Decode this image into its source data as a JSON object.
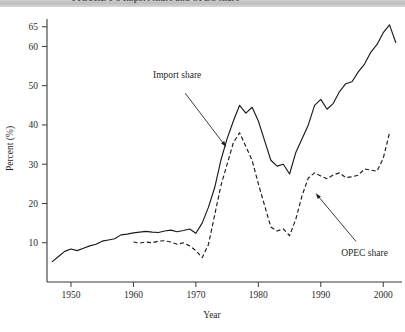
{
  "page": {
    "cut_off_header_text": "FIGURE 1-3  Import share and OPEC share"
  },
  "chart_data": {
    "type": "line",
    "title": "",
    "xlabel": "Year",
    "ylabel": "Percent (%)",
    "xlim": [
      1946,
      2003
    ],
    "ylim": [
      0,
      68
    ],
    "grid": false,
    "legend_position": "inline-annotations",
    "xticks": [
      1950,
      1960,
      1970,
      1980,
      1990,
      2000
    ],
    "xtick_labels": [
      "1950",
      "1960",
      "1970",
      "1980",
      "1990",
      "2000"
    ],
    "yticks": [
      10,
      20,
      30,
      40,
      50,
      60,
      65
    ],
    "ytick_labels": [
      "10",
      "20",
      "30",
      "40",
      "50",
      "60",
      "65"
    ],
    "annotations": [
      {
        "name": "import-share-annotation",
        "label": "Import share",
        "label_x": 1967.0,
        "label_y": 52.0,
        "target_x": 1975.0,
        "target_y": 34.0
      },
      {
        "name": "opec-share-annotation",
        "label": "OPEC share",
        "label_x": 1997.0,
        "label_y": 6.5,
        "target_x": 1989.0,
        "target_y": 23.0
      }
    ],
    "series": [
      {
        "name": "Import share",
        "style": "solid",
        "color": "#1b1b1b",
        "x": [
          1947,
          1948,
          1949,
          1950,
          1951,
          1952,
          1953,
          1954,
          1955,
          1956,
          1957,
          1958,
          1959,
          1960,
          1961,
          1962,
          1963,
          1964,
          1965,
          1966,
          1967,
          1968,
          1969,
          1970,
          1971,
          1972,
          1973,
          1974,
          1975,
          1976,
          1977,
          1978,
          1979,
          1980,
          1981,
          1982,
          1983,
          1984,
          1985,
          1986,
          1987,
          1988,
          1989,
          1990,
          1991,
          1992,
          1993,
          1994,
          1995,
          1996,
          1997,
          1998,
          1999,
          2000,
          2001,
          2002
        ],
        "y": [
          5.2,
          6.5,
          7.8,
          8.4,
          8.0,
          8.6,
          9.2,
          9.6,
          10.4,
          10.7,
          11.0,
          12.0,
          12.2,
          12.5,
          12.7,
          12.9,
          12.7,
          12.6,
          13.0,
          13.2,
          12.8,
          13.1,
          13.5,
          12.4,
          15.0,
          19.0,
          24.0,
          31.0,
          36.5,
          41.0,
          45.0,
          43.0,
          44.5,
          41.0,
          36.0,
          31.0,
          29.5,
          30.0,
          27.5,
          33.0,
          36.5,
          40.0,
          45.0,
          46.5,
          44.0,
          45.5,
          48.5,
          50.5,
          51.0,
          53.5,
          55.5,
          58.5,
          60.5,
          63.5,
          65.5,
          61.0
        ]
      },
      {
        "name": "OPEC share",
        "style": "dashed",
        "color": "#1b1b1b",
        "x": [
          1960,
          1961,
          1962,
          1963,
          1964,
          1965,
          1966,
          1967,
          1968,
          1969,
          1970,
          1971,
          1972,
          1973,
          1974,
          1975,
          1976,
          1977,
          1978,
          1979,
          1980,
          1981,
          1982,
          1983,
          1984,
          1985,
          1986,
          1987,
          1988,
          1989,
          1990,
          1991,
          1992,
          1993,
          1994,
          1995,
          1996,
          1997,
          1998,
          1999,
          2000,
          2001
        ],
        "y": [
          10.2,
          9.9,
          10.2,
          10.0,
          10.4,
          10.5,
          10.2,
          9.6,
          10.0,
          9.2,
          8.0,
          6.2,
          9.5,
          17.0,
          24.5,
          30.0,
          35.5,
          38.0,
          34.5,
          31.0,
          25.0,
          19.5,
          14.0,
          13.0,
          13.5,
          11.8,
          16.0,
          22.0,
          26.5,
          27.8,
          27.0,
          26.3,
          27.3,
          27.8,
          26.6,
          26.8,
          27.2,
          28.8,
          28.5,
          28.2,
          31.5,
          38.0
        ]
      }
    ]
  }
}
